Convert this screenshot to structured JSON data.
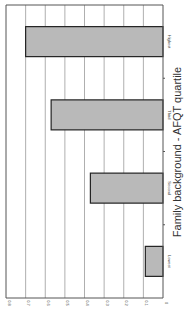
{
  "chart_data": {
    "type": "bar",
    "orientation": "rotated-90-clockwise",
    "title": "",
    "xlabel": "Family background - AFQT quartile",
    "ylabel": "",
    "categories": [
      "Lowest",
      "Second",
      "Third",
      "Highest"
    ],
    "values": [
      0.09,
      0.37,
      0.57,
      0.7
    ],
    "ylim": [
      0,
      0.8
    ],
    "yticks": [
      "0",
      "0.1",
      "0.2",
      "0.3",
      "0.4",
      "0.5",
      "0.6",
      "0.7",
      "0.8"
    ],
    "grid": true,
    "legend": null,
    "bar_color": "#b9b9b9",
    "bar_edge_color": "#222222"
  }
}
